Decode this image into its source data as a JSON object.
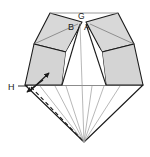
{
  "figure": {
    "type": "geometric-folding-diagram",
    "background_color": "#ffffff",
    "stroke_color": "#1a1a1a",
    "thin_stroke_color": "#6e6e6e",
    "shade_fill": "#d4d4d4",
    "shade_fill_light": "#dedede",
    "shade_fill_dark": "#c6c6c6",
    "labels": [
      {
        "id": "label-G",
        "text": "G",
        "x": 78,
        "y": 19,
        "size": "small"
      },
      {
        "id": "label-B",
        "text": "B",
        "x": 70,
        "y": 29,
        "size": "normal"
      },
      {
        "id": "label-A",
        "text": "A",
        "x": 85,
        "y": 29,
        "size": "normal"
      },
      {
        "id": "label-H",
        "text": "H",
        "x": 10,
        "y": 89,
        "size": "normal"
      }
    ],
    "vertices": {
      "apex_bottom": {
        "x": 84,
        "y": 142
      },
      "top_left_corner": {
        "x": 50,
        "y": 13
      },
      "top_right_corner": {
        "x": 118,
        "y": 13
      },
      "left_outer": {
        "x": 25,
        "y": 85
      },
      "right_outer": {
        "x": 143,
        "y": 85
      },
      "center_G": {
        "x": 82,
        "y": 22
      },
      "center_B": {
        "x": 76,
        "y": 27
      },
      "center_A": {
        "x": 84,
        "y": 27
      }
    },
    "annotations": {
      "arrow_count": 2,
      "arrow_style": "double-headed-fold-arrows",
      "dashed_line": "fold-crease-left",
      "fan_line_count": 7
    }
  }
}
